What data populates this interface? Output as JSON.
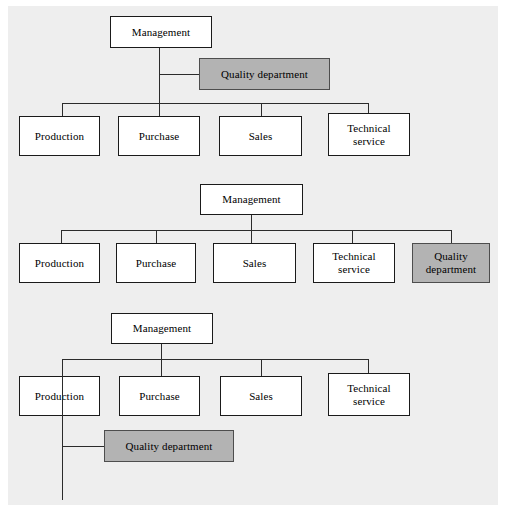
{
  "figure": {
    "type": "organizational-chart-set",
    "background_color": "#eeeeee",
    "node_fill": "#ffffff",
    "highlight_fill": "#b3b3b3",
    "line_color": "#2b2b2b"
  },
  "charts": [
    {
      "id": "variant-1",
      "caption": "",
      "nodes": {
        "management": "Management",
        "quality": "Quality department",
        "production": "Production",
        "purchase": "Purchase",
        "sales": "Sales",
        "technical": "Technical\nservice",
        "technical_line1": "Technical",
        "technical_line2": "service"
      }
    },
    {
      "id": "variant-2",
      "caption": "",
      "nodes": {
        "management": "Management",
        "production": "Production",
        "purchase": "Purchase",
        "sales": "Sales",
        "technical_line1": "Technical",
        "technical_line2": "service",
        "quality_line1": "Quality",
        "quality_line2": "department"
      }
    },
    {
      "id": "variant-3",
      "caption": "",
      "nodes": {
        "management": "Management",
        "production": "Production",
        "purchase": "Purchase",
        "sales": "Sales",
        "technical_line1": "Technical",
        "technical_line2": "service",
        "quality": "Quality department"
      }
    }
  ]
}
